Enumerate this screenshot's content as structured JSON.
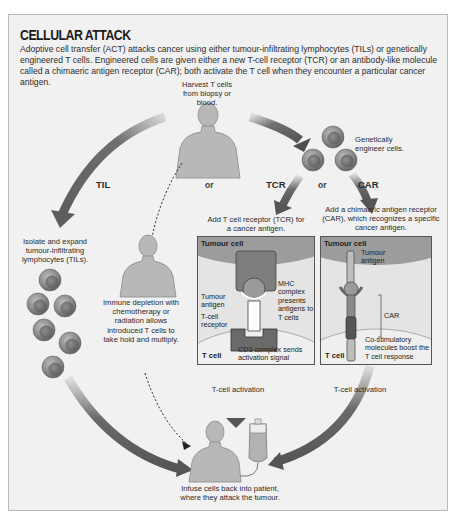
{
  "title": "CELLULAR ATTACK",
  "intro": "Adoptive cell transfer (ACT) attacks cancer using either tumour-infiltrating lymphocytes (TILs) or genetically engineered T cells. Engineered cells are given either a new T-cell receptor (TCR) or an antibody-like molecule called a chimaeric antigen receptor (CAR); both activate the T cell when they encounter a particular cancer antigen.",
  "steps": {
    "harvest": "Harvest T cells from biopsy or blood.",
    "engineer": "Genetically engineer cells.",
    "til_step": "Isolate and expand tumour-infiltrating lymphocytes (TILs).",
    "depletion": "Immune depletion with chemotherapy or radiation allows introduced T cells to take hold and multiply.",
    "tcr_step": "Add T cell receptor (TCR) for a cancer antigen.",
    "car_step": "Add a chimaeric antigen receptor (CAR), which recognizes a specific cancer antigen.",
    "infuse": "Infuse cells back into patient, where they attack the tumour."
  },
  "branches": {
    "til": "TIL",
    "or_1": "or",
    "tcr": "TCR",
    "or_2": "or",
    "car": "CAR"
  },
  "tcr_panel": {
    "tumour_cell": "Tumour cell",
    "tumour_antigen": "Tumour antigen",
    "mhc": "MHC complex presents antigens to T cells",
    "receptor": "T-cell receptor",
    "t_cell": "T cell",
    "cd3": "CD3 complex sends activation signal"
  },
  "car_panel": {
    "tumour_cell": "Tumour cell",
    "tumour_antigen": "Tumour antigen",
    "car": "CAR",
    "t_cell": "T cell",
    "costim": "Co-stimulatory molecules boost the T cell response"
  },
  "activation": {
    "tcr": "T-cell activation",
    "car": "T-cell activation"
  }
}
